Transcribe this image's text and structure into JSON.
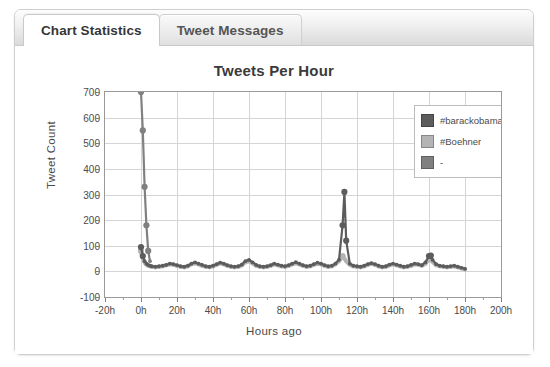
{
  "window": {
    "tabs": [
      {
        "label": "Chart Statistics",
        "active": true
      },
      {
        "label": "Tweet Messages",
        "active": false
      }
    ]
  },
  "chart": {
    "title": "Tweets Per Hour",
    "xlabel": "Hours ago",
    "ylabel": "Tweet Count"
  },
  "legend": {
    "items": [
      {
        "label": "#barackobama",
        "color": "#5c5c5c"
      },
      {
        "label": "#Boehner",
        "color": "#b4b4b4"
      },
      {
        "label": "-",
        "color": "#808080"
      }
    ]
  },
  "chart_data": {
    "type": "line",
    "title": "Tweets Per Hour",
    "xlabel": "Hours ago",
    "ylabel": "Tweet Count",
    "xlim": [
      -20,
      200
    ],
    "ylim": [
      -100,
      700
    ],
    "xticks": [
      "-20h",
      "0h",
      "20h",
      "40h",
      "60h",
      "80h",
      "100h",
      "120h",
      "140h",
      "160h",
      "180h",
      "200h"
    ],
    "xtick_values": [
      -20,
      0,
      20,
      40,
      60,
      80,
      100,
      120,
      140,
      160,
      180,
      200
    ],
    "yticks": [
      -100,
      0,
      100,
      200,
      300,
      400,
      500,
      600,
      700
    ],
    "grid": true,
    "legend_position": "upper right",
    "series": [
      {
        "name": "#barackobama",
        "color": "#5c5c5c",
        "x": [
          0,
          1,
          2,
          3,
          4,
          5,
          6,
          8,
          10,
          12,
          14,
          16,
          18,
          20,
          22,
          24,
          26,
          28,
          30,
          32,
          34,
          36,
          38,
          40,
          42,
          44,
          46,
          48,
          50,
          52,
          54,
          56,
          58,
          60,
          62,
          64,
          66,
          68,
          70,
          72,
          74,
          76,
          78,
          80,
          82,
          84,
          86,
          88,
          90,
          92,
          94,
          96,
          98,
          100,
          102,
          104,
          106,
          108,
          110,
          112,
          113,
          114,
          116,
          118,
          120,
          122,
          124,
          126,
          128,
          130,
          132,
          134,
          136,
          138,
          140,
          142,
          144,
          146,
          148,
          150,
          152,
          154,
          156,
          158,
          160,
          161,
          162,
          164,
          166,
          168,
          170,
          172,
          174,
          176,
          178,
          180
        ],
        "y": [
          95,
          60,
          40,
          30,
          25,
          22,
          20,
          18,
          20,
          22,
          25,
          30,
          28,
          24,
          20,
          18,
          22,
          30,
          35,
          30,
          25,
          20,
          18,
          22,
          28,
          34,
          30,
          24,
          20,
          18,
          20,
          26,
          40,
          45,
          35,
          25,
          20,
          18,
          20,
          24,
          30,
          26,
          22,
          20,
          24,
          30,
          36,
          30,
          24,
          20,
          22,
          28,
          34,
          30,
          24,
          20,
          22,
          30,
          45,
          180,
          310,
          120,
          30,
          22,
          20,
          18,
          22,
          28,
          32,
          28,
          22,
          18,
          20,
          26,
          30,
          26,
          22,
          18,
          20,
          25,
          30,
          28,
          24,
          35,
          60,
          62,
          45,
          28,
          22,
          20,
          18,
          20,
          22,
          18,
          14,
          10
        ]
      },
      {
        "name": "#Boehner",
        "color": "#b4b4b4",
        "x": [
          0,
          1,
          2,
          3,
          4,
          5,
          6,
          8,
          10,
          12,
          14,
          16,
          18,
          20,
          22,
          24,
          26,
          28,
          30,
          32,
          34,
          36,
          38,
          40,
          42,
          44,
          46,
          48,
          50,
          52,
          54,
          56,
          58,
          60,
          62,
          64,
          66,
          68,
          70,
          72,
          74,
          76,
          78,
          80,
          82,
          84,
          86,
          88,
          90,
          92,
          94,
          96,
          98,
          100,
          102,
          104,
          106,
          108,
          110,
          112,
          114,
          116,
          118,
          120,
          122,
          124,
          126,
          128,
          130,
          132,
          134,
          136,
          138,
          140,
          142,
          144,
          146,
          148,
          150,
          152,
          154,
          156,
          158,
          160,
          162,
          164,
          166,
          168,
          170,
          172,
          174,
          176,
          178,
          180
        ],
        "y": [
          80,
          50,
          35,
          26,
          22,
          20,
          18,
          16,
          18,
          20,
          24,
          28,
          26,
          22,
          18,
          16,
          20,
          28,
          32,
          28,
          22,
          18,
          16,
          20,
          26,
          32,
          28,
          22,
          18,
          16,
          18,
          24,
          36,
          40,
          32,
          22,
          18,
          16,
          18,
          22,
          28,
          24,
          20,
          18,
          22,
          28,
          32,
          28,
          22,
          18,
          20,
          26,
          30,
          28,
          22,
          18,
          20,
          28,
          40,
          60,
          40,
          26,
          20,
          18,
          16,
          20,
          26,
          30,
          26,
          20,
          16,
          18,
          24,
          28,
          24,
          20,
          16,
          18,
          22,
          28,
          26,
          22,
          30,
          48,
          38,
          24,
          20,
          18,
          16,
          18,
          20,
          16,
          12,
          8
        ]
      },
      {
        "name": "-",
        "color": "#808080",
        "x": [
          0,
          1,
          2,
          3,
          4,
          5
        ],
        "y": [
          700,
          550,
          330,
          180,
          80,
          40
        ],
        "note": "steep drop spike at 0h reaching beyond top of axis"
      }
    ],
    "annotations": [
      {
        "text": "spike at 0h",
        "x": 0,
        "y": 700
      },
      {
        "text": "spike at 113h",
        "x": 113,
        "y": 310
      },
      {
        "text": "bump at 160h",
        "x": 160,
        "y": 62
      }
    ]
  }
}
